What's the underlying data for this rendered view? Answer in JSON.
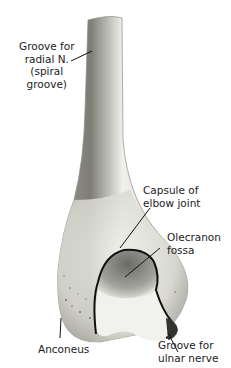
{
  "figure": {
    "labels": {
      "groove_radial": "Groove for\nradial N.\n(spiral\ngroove)",
      "capsule": "Capsule of\nelbow joint",
      "olecranon": "Olecranon\nfossa",
      "anconeus": "Anconeus",
      "groove_ulnar": "Groove for\nulnar nerve"
    },
    "colors": {
      "bone_light": "#efefe9",
      "bone_shade": "#9a9a92",
      "outline": "#1a1a1a"
    }
  }
}
